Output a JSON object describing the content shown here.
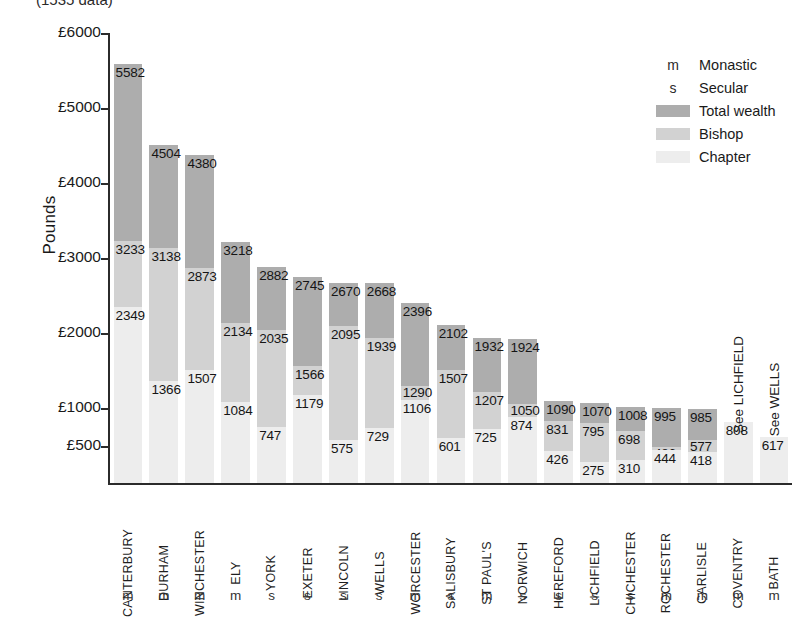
{
  "chart_data": {
    "type": "bar",
    "title": "(1535 data)",
    "subtype": "stacked-bar",
    "xlabel": "",
    "ylabel": "Pounds",
    "ylim": [
      0,
      6000
    ],
    "ytick_labels": [
      "£500",
      "£1000",
      "£2000",
      "£3000",
      "£4000",
      "£5000",
      "£6000"
    ],
    "ytick_values": [
      500,
      1000,
      2000,
      3000,
      4000,
      5000,
      6000
    ],
    "grid": false,
    "legend_position": "top-right",
    "categories": [
      "CANTERBURY",
      "DURHAM",
      "WINCHESTER",
      "ELY",
      "YORK",
      "EXETER",
      "LINCOLN",
      "WELLS",
      "WORCESTER",
      "SALISBURY",
      "ST PAUL'S",
      "NORWICH",
      "HEREFORD",
      "LICHFIELD",
      "CHICHESTER",
      "ROCHESTER",
      "CARLISLE",
      "COVENTRY",
      "BATH"
    ],
    "category_types": [
      "m",
      "m",
      "m",
      "m",
      "s",
      "s",
      "s",
      "s",
      "m",
      "s",
      "m",
      "s",
      "s",
      "s",
      "s",
      "m",
      "m",
      "m",
      "m"
    ],
    "series": [
      {
        "name": "Total wealth",
        "color": "#adadad",
        "values": [
          5582,
          4504,
          4380,
          3218,
          2882,
          2745,
          2670,
          2668,
          2396,
          2102,
          1932,
          1924,
          1090,
          1070,
          1008,
          995,
          985,
          null,
          null
        ]
      },
      {
        "name": "Bishop",
        "color": "#d2d2d2",
        "values": [
          3233,
          3138,
          2873,
          2134,
          2035,
          1566,
          2095,
          1939,
          1290,
          1507,
          1207,
          1050,
          831,
          795,
          698,
          486,
          577,
          null,
          null
        ]
      },
      {
        "name": "Chapter",
        "color": "#ededed",
        "values": [
          2349,
          1366,
          1507,
          1084,
          747,
          1179,
          575,
          729,
          1106,
          601,
          725,
          874,
          426,
          275,
          310,
          444,
          418,
          808,
          617
        ]
      }
    ],
    "bars": [
      {
        "name": "CANTERBURY",
        "type": "m",
        "total": 5582,
        "bishop": 3233,
        "chapter": 2349,
        "note": ""
      },
      {
        "name": "DURHAM",
        "type": "m",
        "total": 4504,
        "bishop": 3138,
        "chapter": 1366,
        "note": ""
      },
      {
        "name": "WINCHESTER",
        "type": "m",
        "total": 4380,
        "bishop": 2873,
        "chapter": 1507,
        "note": ""
      },
      {
        "name": "ELY",
        "type": "m",
        "total": 3218,
        "bishop": 2134,
        "chapter": 1084,
        "note": ""
      },
      {
        "name": "YORK",
        "type": "s",
        "total": 2882,
        "bishop": 2035,
        "chapter": 747,
        "note": ""
      },
      {
        "name": "EXETER",
        "type": "s",
        "total": 2745,
        "bishop": 1566,
        "chapter": 1179,
        "note": ""
      },
      {
        "name": "LINCOLN",
        "type": "s",
        "total": 2670,
        "bishop": 2095,
        "chapter": 575,
        "note": ""
      },
      {
        "name": "WELLS",
        "type": "s",
        "total": 2668,
        "bishop": 1939,
        "chapter": 729,
        "note": ""
      },
      {
        "name": "WORCESTER",
        "type": "m",
        "total": 2396,
        "bishop": 1290,
        "chapter": 1106,
        "note": ""
      },
      {
        "name": "SALISBURY",
        "type": "s",
        "total": 2102,
        "bishop": 1507,
        "chapter": 601,
        "note": ""
      },
      {
        "name": "ST PAUL'S",
        "type": "m",
        "total": 1932,
        "bishop": 1207,
        "chapter": 725,
        "note": ""
      },
      {
        "name": "NORWICH",
        "type": "s",
        "total": 1924,
        "bishop": 1050,
        "chapter": 874,
        "note": ""
      },
      {
        "name": "HEREFORD",
        "type": "s",
        "total": 1090,
        "bishop": 831,
        "chapter": 426,
        "note": ""
      },
      {
        "name": "LICHFIELD",
        "type": "s",
        "total": 1070,
        "bishop": 795,
        "chapter": 275,
        "note": ""
      },
      {
        "name": "CHICHESTER",
        "type": "s",
        "total": 1008,
        "bishop": 698,
        "chapter": 310,
        "note": ""
      },
      {
        "name": "ROCHESTER",
        "type": "m",
        "total": 995,
        "bishop": 486,
        "chapter": 444,
        "note": ""
      },
      {
        "name": "CARLISLE",
        "type": "m",
        "total": 985,
        "bishop": 577,
        "chapter": 418,
        "note": ""
      },
      {
        "name": "COVENTRY",
        "type": "m",
        "total": null,
        "bishop": null,
        "chapter": 808,
        "note": "See LICHFIELD"
      },
      {
        "name": "BATH",
        "type": "m",
        "total": null,
        "bishop": null,
        "chapter": 617,
        "note": "See WELLS"
      }
    ]
  },
  "legend": {
    "items": [
      {
        "kind": "key",
        "key": "m",
        "label": "Monastic",
        "color": ""
      },
      {
        "kind": "key",
        "key": "s",
        "label": "Secular",
        "color": ""
      },
      {
        "kind": "swatch",
        "key": "",
        "label": "Total wealth",
        "color": "#adadad"
      },
      {
        "kind": "swatch",
        "key": "",
        "label": "Bishop",
        "color": "#d2d2d2"
      },
      {
        "kind": "swatch",
        "key": "",
        "label": "Chapter",
        "color": "#ededed"
      }
    ]
  }
}
